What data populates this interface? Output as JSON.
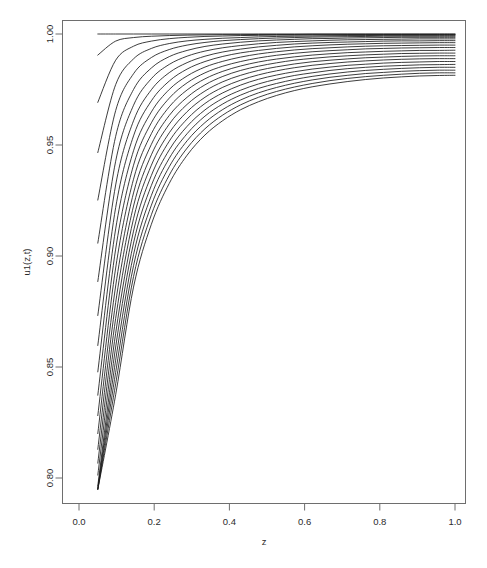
{
  "figure": {
    "background_color": "#ffffff",
    "line_color": "#1a1a1a",
    "frame_color": "#6e6e6e",
    "width": 487,
    "height": 568
  },
  "axes": {
    "x_title": "z",
    "y_title": "u1(z,t)",
    "x_ticks": [
      "0.0",
      "0.2",
      "0.4",
      "0.6",
      "0.8",
      "1.0"
    ],
    "y_ticks": [
      "0.80",
      "0.85",
      "0.90",
      "0.95",
      "1.00"
    ]
  },
  "chart_data": {
    "type": "line",
    "title": "",
    "subtitle": "",
    "xlabel": "z",
    "ylabel": "u1(z,t)",
    "xlim": [
      0.0,
      1.0
    ],
    "ylim": [
      0.795,
      1.003
    ],
    "grid": false,
    "legend": "none",
    "x_tick_values": [
      0.0,
      0.2,
      0.4,
      0.6,
      0.8,
      1.0
    ],
    "y_tick_values": [
      0.8,
      0.85,
      0.9,
      0.95,
      1.0
    ],
    "x_tick_labels": [
      "0.0",
      "0.2",
      "0.4",
      "0.6",
      "0.8",
      "1.0"
    ],
    "y_tick_labels": [
      "0.80",
      "0.85",
      "0.90",
      "0.95",
      "1.00"
    ],
    "x_domain_start": 0.05,
    "x_domain_end": 1.0,
    "n_series": 21,
    "series_note": "Family of solution curves u1(z,t) for increasing t; each curve begins at z=0.05 and rises monotonically toward u1=1.00 at z=1.0.",
    "x": [
      0.05,
      0.0975,
      0.145,
      0.1925,
      0.24,
      0.2875,
      0.335,
      0.3825,
      0.43,
      0.4775,
      0.525,
      0.5725,
      0.62,
      0.6675,
      0.715,
      0.7625,
      0.81,
      0.8575,
      0.905,
      0.9525,
      1.0
    ],
    "series": [
      {
        "name": "t01",
        "values": [
          1.0,
          1.0,
          1.0,
          1.0,
          1.0,
          1.0,
          1.0,
          1.0,
          1.0,
          1.0,
          1.0,
          1.0,
          1.0,
          1.0,
          1.0,
          1.0,
          1.0,
          1.0,
          1.0,
          1.0,
          1.0
        ]
      },
      {
        "name": "t02",
        "values": [
          0.9905,
          0.9968,
          0.9984,
          0.999,
          0.9993,
          0.9995,
          0.9996,
          0.9997,
          0.9997,
          0.9998,
          0.9998,
          0.9998,
          0.9999,
          0.9999,
          0.9999,
          0.9999,
          0.9999,
          0.9999,
          0.9999,
          0.9999,
          0.9999
        ]
      },
      {
        "name": "t03",
        "values": [
          0.9692,
          0.9882,
          0.9945,
          0.9968,
          0.9979,
          0.9985,
          0.9989,
          0.9991,
          0.9993,
          0.9994,
          0.9995,
          0.9995,
          0.9996,
          0.9996,
          0.9997,
          0.9997,
          0.9997,
          0.9997,
          0.9997,
          0.9997,
          0.9997
        ]
      },
      {
        "name": "t04",
        "values": [
          0.9466,
          0.9772,
          0.9888,
          0.9935,
          0.9957,
          0.9969,
          0.9976,
          0.9981,
          0.9984,
          0.9987,
          0.9989,
          0.999,
          0.9991,
          0.9992,
          0.9993,
          0.9993,
          0.9994,
          0.9994,
          0.9994,
          0.9994,
          0.9994
        ]
      },
      {
        "name": "t05",
        "values": [
          0.9252,
          0.9655,
          0.9821,
          0.9894,
          0.993,
          0.995,
          0.9962,
          0.997,
          0.9975,
          0.9979,
          0.9982,
          0.9984,
          0.9986,
          0.9987,
          0.9988,
          0.9989,
          0.999,
          0.999,
          0.999,
          0.999,
          0.999
        ]
      },
      {
        "name": "t06",
        "values": [
          0.9058,
          0.9539,
          0.975,
          0.9847,
          0.9898,
          0.9926,
          0.9944,
          0.9955,
          0.9963,
          0.9969,
          0.9973,
          0.9976,
          0.9979,
          0.998,
          0.9982,
          0.9983,
          0.9984,
          0.9985,
          0.9985,
          0.9985,
          0.9985
        ]
      },
      {
        "name": "t07",
        "values": [
          0.8885,
          0.9427,
          0.9679,
          0.9799,
          0.9863,
          0.99,
          0.9923,
          0.9938,
          0.9948,
          0.9956,
          0.9962,
          0.9966,
          0.9969,
          0.9972,
          0.9974,
          0.9975,
          0.9976,
          0.9977,
          0.9978,
          0.9978,
          0.9978
        ]
      },
      {
        "name": "t08",
        "values": [
          0.8732,
          0.932,
          0.9609,
          0.9749,
          0.9826,
          0.9871,
          0.99,
          0.9919,
          0.9932,
          0.9942,
          0.9949,
          0.9955,
          0.9959,
          0.9962,
          0.9964,
          0.9966,
          0.9968,
          0.9969,
          0.9969,
          0.997,
          0.997
        ]
      },
      {
        "name": "t09",
        "values": [
          0.8597,
          0.9218,
          0.9541,
          0.9699,
          0.9788,
          0.9842,
          0.9876,
          0.9899,
          0.9915,
          0.9926,
          0.9935,
          0.9942,
          0.9947,
          0.9951,
          0.9954,
          0.9956,
          0.9958,
          0.9959,
          0.996,
          0.9961,
          0.9961
        ]
      },
      {
        "name": "t10",
        "values": [
          0.8478,
          0.9122,
          0.9474,
          0.9649,
          0.975,
          0.9811,
          0.9851,
          0.9877,
          0.9896,
          0.991,
          0.992,
          0.9928,
          0.9934,
          0.9938,
          0.9942,
          0.9945,
          0.9947,
          0.9948,
          0.9949,
          0.995,
          0.995
        ]
      },
      {
        "name": "t11",
        "values": [
          0.8373,
          0.9031,
          0.9409,
          0.96,
          0.9711,
          0.978,
          0.9825,
          0.9855,
          0.9876,
          0.9892,
          0.9904,
          0.9913,
          0.992,
          0.9925,
          0.9929,
          0.9933,
          0.9935,
          0.9937,
          0.9938,
          0.9939,
          0.9939
        ]
      },
      {
        "name": "t12",
        "values": [
          0.8281,
          0.8946,
          0.9346,
          0.9551,
          0.9672,
          0.9748,
          0.9798,
          0.9832,
          0.9856,
          0.9874,
          0.9887,
          0.9897,
          0.9905,
          0.9911,
          0.9916,
          0.9919,
          0.9922,
          0.9924,
          0.9926,
          0.9926,
          0.9927
        ]
      },
      {
        "name": "t13",
        "values": [
          0.82,
          0.8865,
          0.9284,
          0.9503,
          0.9633,
          0.9715,
          0.9771,
          0.9809,
          0.9836,
          0.9855,
          0.987,
          0.9882,
          0.989,
          0.9897,
          0.9902,
          0.9906,
          0.9909,
          0.9912,
          0.9913,
          0.9914,
          0.9914
        ]
      },
      {
        "name": "t14",
        "values": [
          0.8129,
          0.879,
          0.9225,
          0.9456,
          0.9594,
          0.9683,
          0.9743,
          0.9785,
          0.9814,
          0.9836,
          0.9852,
          0.9865,
          0.9875,
          0.9882,
          0.9888,
          0.9893,
          0.9896,
          0.9899,
          0.9901,
          0.9902,
          0.9902
        ]
      },
      {
        "name": "t15",
        "values": [
          0.8067,
          0.8719,
          0.9168,
          0.9409,
          0.9555,
          0.965,
          0.9715,
          0.976,
          0.9792,
          0.9816,
          0.9834,
          0.9848,
          0.9859,
          0.9867,
          0.9874,
          0.9879,
          0.9883,
          0.9886,
          0.9888,
          0.9889,
          0.9889
        ]
      },
      {
        "name": "t16",
        "values": [
          0.8013,
          0.8652,
          0.9112,
          0.9363,
          0.9517,
          0.9617,
          0.9687,
          0.9735,
          0.977,
          0.9796,
          0.9815,
          0.983,
          0.9842,
          0.9851,
          0.9859,
          0.9864,
          0.9869,
          0.9872,
          0.9874,
          0.9876,
          0.9876
        ]
      },
      {
        "name": "t17",
        "values": [
          0.7965,
          0.859,
          0.9058,
          0.9318,
          0.9478,
          0.9584,
          0.9658,
          0.971,
          0.9747,
          0.9775,
          0.9796,
          0.9813,
          0.9825,
          0.9836,
          0.9844,
          0.985,
          0.9855,
          0.9858,
          0.9861,
          0.9862,
          0.9863
        ]
      },
      {
        "name": "t18",
        "values": [
          0.7952,
          0.8531,
          0.9006,
          0.9273,
          0.944,
          0.9551,
          0.963,
          0.9685,
          0.9725,
          0.9755,
          0.9777,
          0.9795,
          0.9809,
          0.982,
          0.9829,
          0.9836,
          0.9841,
          0.9845,
          0.9848,
          0.985,
          0.985
        ]
      },
      {
        "name": "t19",
        "values": [
          0.795,
          0.8476,
          0.8956,
          0.9229,
          0.9402,
          0.9519,
          0.9601,
          0.966,
          0.9703,
          0.9735,
          0.9759,
          0.9778,
          0.9793,
          0.9805,
          0.9814,
          0.9822,
          0.9827,
          0.9832,
          0.9835,
          0.9837,
          0.9837
        ]
      },
      {
        "name": "t20",
        "values": [
          0.7949,
          0.8424,
          0.8907,
          0.9186,
          0.9364,
          0.9486,
          0.9573,
          0.9635,
          0.9681,
          0.9715,
          0.9741,
          0.9761,
          0.9777,
          0.979,
          0.98,
          0.9808,
          0.9814,
          0.9819,
          0.9823,
          0.9825,
          0.9825
        ]
      },
      {
        "name": "t21",
        "values": [
          0.7948,
          0.8375,
          0.886,
          0.9143,
          0.9327,
          0.9454,
          0.9545,
          0.961,
          0.9659,
          0.9695,
          0.9723,
          0.9745,
          0.9762,
          0.9775,
          0.9786,
          0.9795,
          0.9802,
          0.9807,
          0.9811,
          0.9813,
          0.9814
        ]
      }
    ]
  }
}
